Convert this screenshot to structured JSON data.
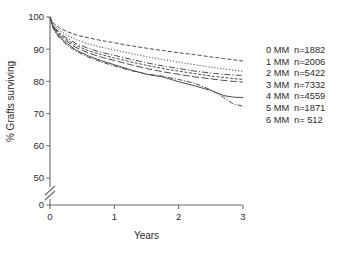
{
  "chart_data": {
    "type": "line",
    "title": "",
    "subtitle": "",
    "xlabel": "Years",
    "ylabel": "% Grafts surviving",
    "xlim": [
      0,
      3
    ],
    "ylim": [
      50,
      100
    ],
    "y_axis_break": true,
    "y_break_value": 0,
    "grid": false,
    "legend_position": "right",
    "xticks": [
      "0",
      "1",
      "2",
      "3"
    ],
    "xtick_values": [
      0,
      1,
      2,
      3
    ],
    "yticks": [
      "0",
      "50",
      "60",
      "70",
      "80",
      "90",
      "100"
    ],
    "ytick_values": [
      0,
      50,
      60,
      70,
      80,
      90,
      100
    ],
    "x": [
      0,
      0.04,
      0.08,
      0.15,
      0.25,
      0.4,
      0.6,
      0.8,
      1.0,
      1.25,
      1.5,
      1.75,
      2.0,
      2.25,
      2.5,
      2.7,
      2.85,
      3.0
    ],
    "series": [
      {
        "name": "0 MM",
        "label": "0 MM",
        "n_label": "n=1882",
        "n": 1882,
        "dash": "4,2",
        "values": [
          100,
          98.4,
          97.6,
          96.6,
          95.6,
          94.5,
          93.5,
          92.7,
          92.0,
          91.1,
          90.3,
          89.6,
          88.9,
          88.3,
          87.6,
          87.1,
          86.7,
          86.3
        ]
      },
      {
        "name": "1 MM",
        "label": "1 MM",
        "n_label": "n=2006",
        "n": 2006,
        "dash": "1.2,1.8",
        "values": [
          100,
          98.0,
          97.0,
          95.8,
          94.5,
          93.0,
          91.6,
          90.6,
          89.8,
          88.7,
          87.7,
          86.8,
          86.0,
          85.2,
          84.4,
          83.9,
          83.5,
          83.1
        ]
      },
      {
        "name": "2 MM",
        "label": "2 MM",
        "n_label": "n=5422",
        "n": 5422,
        "dash": "6,2,1.2,2",
        "values": [
          100,
          97.8,
          96.6,
          95.1,
          93.6,
          91.8,
          90.2,
          89.0,
          88.1,
          86.9,
          85.8,
          84.8,
          84.0,
          83.2,
          82.6,
          82.2,
          82.0,
          81.8
        ]
      },
      {
        "name": "3 MM",
        "label": "3 MM",
        "n_label": "n=7332",
        "n": 7332,
        "dash": "3,1.6",
        "values": [
          100,
          97.6,
          96.3,
          94.7,
          93.1,
          91.2,
          89.5,
          88.3,
          87.3,
          86.1,
          85.0,
          84.0,
          83.2,
          82.4,
          81.7,
          81.2,
          80.9,
          80.6
        ]
      },
      {
        "name": "4 MM",
        "label": "4 MM",
        "n_label": "n=4559",
        "n": 4559,
        "dash": "7,2.5",
        "values": [
          100,
          97.4,
          96.0,
          94.3,
          92.6,
          90.6,
          88.8,
          87.5,
          86.5,
          85.2,
          84.0,
          83.0,
          82.2,
          81.4,
          80.8,
          80.3,
          80.0,
          79.8
        ]
      },
      {
        "name": "5 MM",
        "label": "5 MM",
        "n_label": "n=1871",
        "n": 1871,
        "dash": "none",
        "values": [
          100,
          97.2,
          95.6,
          93.8,
          92.0,
          89.8,
          87.9,
          86.4,
          85.2,
          83.6,
          82.2,
          81.4,
          79.9,
          78.6,
          77.2,
          75.6,
          75.1,
          75.0
        ]
      },
      {
        "name": "6 MM",
        "label": "6 MM",
        "n_label": "n= 512",
        "n": 512,
        "dash": "5,1.6,1.2,1.6",
        "values": [
          100,
          97.0,
          95.3,
          93.4,
          91.5,
          89.4,
          87.5,
          86.0,
          84.8,
          83.4,
          82.3,
          81.6,
          80.6,
          79.4,
          77.4,
          75.0,
          73.0,
          72.3
        ]
      }
    ]
  },
  "legend": {
    "entries": [
      {
        "label": "0 MM",
        "count": "n=1882"
      },
      {
        "label": "1 MM",
        "count": "n=2006"
      },
      {
        "label": "2 MM",
        "count": "n=5422"
      },
      {
        "label": "3 MM",
        "count": "n=7332"
      },
      {
        "label": "4 MM",
        "count": "n=4559"
      },
      {
        "label": "5 MM",
        "count": "n=1871"
      },
      {
        "label": "6 MM",
        "count": "n= 512"
      }
    ]
  },
  "axes": {
    "x_title": "Years",
    "y_title": "% Grafts surviving"
  },
  "colors": {
    "line": "#4d4d4d",
    "axis": "#6b6b6b",
    "text": "#2b2b2b",
    "background": "#ffffff"
  }
}
